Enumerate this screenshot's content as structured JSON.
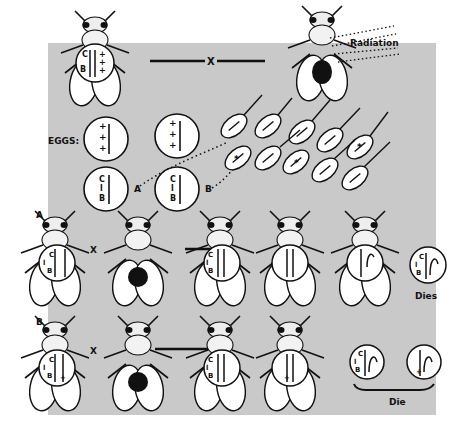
{
  "diagram": {
    "title": "",
    "top_cross": {
      "operator": "X",
      "radiation_label": "Radiation"
    },
    "eggs": {
      "label": "EGGS:",
      "egg_a_label": "A",
      "egg_b_label": "B"
    },
    "row_a": {
      "label": "A",
      "cross": "X",
      "outcome": "Dies"
    },
    "row_b": {
      "label": "B",
      "cross": "X",
      "outcome": "Die"
    },
    "chromosome_labels": {
      "c": "C",
      "l": "l",
      "b": "B",
      "plus": "+"
    },
    "colors": {
      "panel": "#c9c9c9",
      "ink": "#111111",
      "fly_body": "#ffffff"
    }
  }
}
